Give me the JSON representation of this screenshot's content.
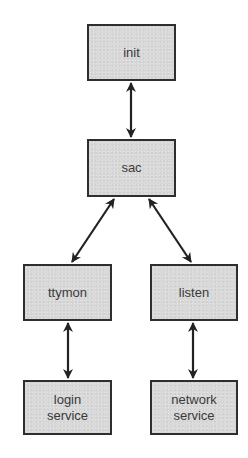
{
  "diagram": {
    "type": "process-hierarchy",
    "colors": {
      "node_fill": "#d9d9d9",
      "node_border": "#2e2e2e",
      "text": "#3a3a3a",
      "arrow": "#222222",
      "background": "#ffffff"
    },
    "nodes": [
      {
        "id": "init",
        "label": "init",
        "x": 87,
        "y": 24,
        "w": 89,
        "h": 57
      },
      {
        "id": "sac",
        "label": "sac",
        "x": 87,
        "y": 139,
        "w": 89,
        "h": 58
      },
      {
        "id": "ttymon",
        "label": "ttymon",
        "x": 23,
        "y": 264,
        "w": 89,
        "h": 57
      },
      {
        "id": "listen",
        "label": "listen",
        "x": 150,
        "y": 264,
        "w": 88,
        "h": 57
      },
      {
        "id": "login-service",
        "label": "login\nservice",
        "x": 23,
        "y": 380,
        "w": 89,
        "h": 55
      },
      {
        "id": "network-service",
        "label": "network\nservice",
        "x": 150,
        "y": 380,
        "w": 88,
        "h": 55
      }
    ],
    "edges": [
      {
        "from": "init",
        "to": "sac",
        "direction": "bidirectional",
        "x1": 131,
        "y1": 83,
        "x2": 131,
        "y2": 137
      },
      {
        "from": "sac",
        "to": "ttymon",
        "direction": "bidirectional",
        "x1": 114,
        "y1": 199,
        "x2": 72,
        "y2": 262
      },
      {
        "from": "sac",
        "to": "listen",
        "direction": "bidirectional",
        "x1": 149,
        "y1": 199,
        "x2": 191,
        "y2": 262
      },
      {
        "from": "ttymon",
        "to": "login-service",
        "direction": "bidirectional",
        "x1": 68,
        "y1": 323,
        "x2": 68,
        "y2": 378
      },
      {
        "from": "listen",
        "to": "network-service",
        "direction": "bidirectional",
        "x1": 193,
        "y1": 323,
        "x2": 193,
        "y2": 378
      }
    ]
  }
}
